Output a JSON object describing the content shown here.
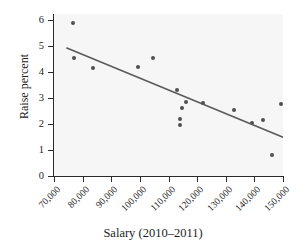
{
  "chart_data": {
    "type": "scatter",
    "title": "",
    "xlabel": "Salary (2010–2011)",
    "ylabel": "Raise percent",
    "xlim": [
      65000,
      152000
    ],
    "ylim": [
      0,
      6.3
    ],
    "xticks": [
      70000,
      80000,
      90000,
      100000,
      110000,
      120000,
      130000,
      140000,
      150000
    ],
    "xticklabels": [
      "70,000",
      "80,000",
      "90,000",
      "100,000",
      "110,000",
      "120,000",
      "130,000",
      "140,000",
      "150,000"
    ],
    "yticks": [
      0,
      1,
      2,
      3,
      4,
      5,
      6
    ],
    "yticklabels": [
      "0",
      "1",
      "2",
      "3",
      "4",
      "5",
      "6"
    ],
    "grid": false,
    "legend": null,
    "point_color": "#4f4f4f",
    "line_color": "#5a5a5a",
    "panel_background": "#f6f6f6",
    "axis_color": "#2b2b2b",
    "points": [
      {
        "x": 76500,
        "y": 5.9
      },
      {
        "x": 77000,
        "y": 4.55
      },
      {
        "x": 83500,
        "y": 4.15
      },
      {
        "x": 99500,
        "y": 4.2
      },
      {
        "x": 104500,
        "y": 4.55
      },
      {
        "x": 113000,
        "y": 3.3
      },
      {
        "x": 114000,
        "y": 2.2
      },
      {
        "x": 114000,
        "y": 1.95
      },
      {
        "x": 114800,
        "y": 2.62
      },
      {
        "x": 116200,
        "y": 2.85
      },
      {
        "x": 122200,
        "y": 2.8
      },
      {
        "x": 133000,
        "y": 2.55
      },
      {
        "x": 139200,
        "y": 2.03
      },
      {
        "x": 143000,
        "y": 2.15
      },
      {
        "x": 146000,
        "y": 0.8
      },
      {
        "x": 149200,
        "y": 2.78
      }
    ],
    "fit_line": {
      "type": "linear-regression",
      "x_start": 74500,
      "y_start": 4.92,
      "x_end": 149800,
      "y_end": 1.5
    }
  }
}
